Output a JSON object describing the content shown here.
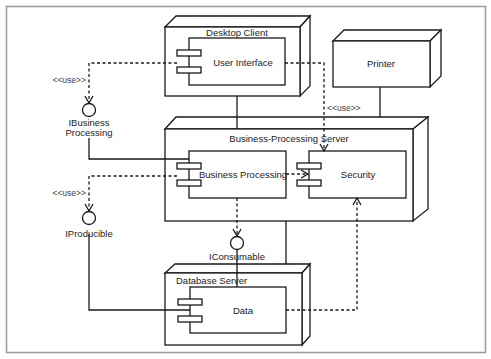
{
  "diagram": {
    "type": "UML deployment diagram",
    "colors": {
      "line": "#1a1a1a",
      "frame": "#9a9a9a",
      "background": "#ffffff"
    },
    "nodes": {
      "desktop_client": {
        "label": "Desktop Client"
      },
      "printer": {
        "label": "Printer"
      },
      "bp_server": {
        "label": "Business-Processing Server"
      },
      "database_server": {
        "label": "Database Server"
      }
    },
    "components": {
      "user_interface": {
        "label": "User Interface"
      },
      "business_processing": {
        "label": "Business Processing"
      },
      "security": {
        "label": "Security"
      },
      "data": {
        "label": "Data"
      }
    },
    "interfaces": {
      "ibusiness": {
        "line1": "IBusiness",
        "line2": "Processing"
      },
      "iproducible": {
        "label": "IProducible"
      },
      "iconsumable": {
        "label": "IConsumable"
      }
    },
    "stereotypes": {
      "use_ui_ibusiness": "<<use>>",
      "use_bp_iproducible": "<<use>>",
      "use_ui_security": "<<use>>"
    }
  }
}
